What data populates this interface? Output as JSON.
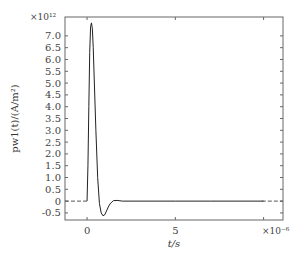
{
  "chart_data": {
    "type": "line",
    "title": "",
    "xlabel": "t/s",
    "ylabel": "pw1(t)/(A/m²)",
    "x_multiplier": "×10⁻⁶",
    "y_multiplier": "×10¹²",
    "xlim": [
      -1.25,
      11.1
    ],
    "ylim": [
      -0.8,
      7.8
    ],
    "xticks": [
      0,
      5,
      10
    ],
    "xtick_labels": [
      "0",
      "5",
      ""
    ],
    "yticks": [
      -0.5,
      0,
      0.5,
      1.0,
      1.5,
      2.0,
      2.5,
      3.0,
      3.5,
      4.0,
      4.5,
      5.0,
      5.5,
      6.0,
      6.5,
      7.0
    ],
    "ytick_labels": [
      "-0.5",
      "0",
      "0.5",
      "1.0",
      "1.5",
      "2.0",
      "2.5",
      "3.0",
      "3.5",
      "4.0",
      "4.5",
      "5.0",
      "5.5",
      "6.0",
      "6.5",
      "7.0"
    ],
    "grid": false,
    "legend": null,
    "series": [
      {
        "name": "pw1(t)",
        "style": "solid",
        "x": [
          0.0,
          0.05,
          0.1,
          0.15,
          0.2,
          0.25,
          0.3,
          0.35,
          0.4,
          0.5,
          0.6,
          0.7,
          0.8,
          0.9,
          1.0,
          1.1,
          1.2,
          1.3,
          1.4,
          1.5,
          1.7,
          2.0,
          3.0,
          5.0,
          7.0,
          9.0,
          10.0
        ],
        "y": [
          0.0,
          1.5,
          4.0,
          6.3,
          7.4,
          7.55,
          7.3,
          6.5,
          5.3,
          3.0,
          1.0,
          -0.1,
          -0.5,
          -0.62,
          -0.58,
          -0.42,
          -0.25,
          -0.12,
          -0.04,
          0.02,
          0.03,
          0.0,
          0.0,
          0.0,
          0.0,
          0.0,
          0.0
        ]
      },
      {
        "name": "baseline-pre",
        "style": "dashed",
        "x": [
          -1.25,
          0.0
        ],
        "y": [
          0.0,
          0.0
        ]
      },
      {
        "name": "baseline-post",
        "style": "dashed",
        "x": [
          9.9,
          11.1
        ],
        "y": [
          0.0,
          0.0
        ]
      }
    ]
  }
}
